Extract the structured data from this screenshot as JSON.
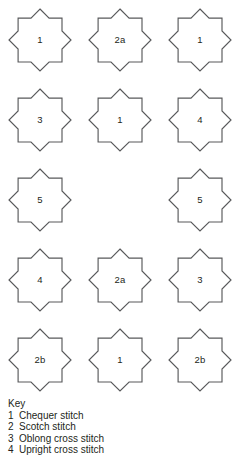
{
  "diagram": {
    "type": "stitch-placement-chart",
    "shape": "eight-pointed-star",
    "columns": 3,
    "rows": 5,
    "outline_color": "#58595b",
    "fill_color": "#ffffff",
    "text_color": "#231f20",
    "cells": [
      {
        "row": 1,
        "col": 1,
        "label": "1",
        "empty": false
      },
      {
        "row": 1,
        "col": 2,
        "label": "2a",
        "empty": false
      },
      {
        "row": 1,
        "col": 3,
        "label": "1",
        "empty": false
      },
      {
        "row": 2,
        "col": 1,
        "label": "3",
        "empty": false
      },
      {
        "row": 2,
        "col": 2,
        "label": "1",
        "empty": false
      },
      {
        "row": 2,
        "col": 3,
        "label": "4",
        "empty": false
      },
      {
        "row": 3,
        "col": 1,
        "label": "5",
        "empty": false
      },
      {
        "row": 3,
        "col": 2,
        "label": "",
        "empty": true
      },
      {
        "row": 3,
        "col": 3,
        "label": "5",
        "empty": false
      },
      {
        "row": 4,
        "col": 1,
        "label": "4",
        "empty": false
      },
      {
        "row": 4,
        "col": 2,
        "label": "2a",
        "empty": false
      },
      {
        "row": 4,
        "col": 3,
        "label": "3",
        "empty": false
      },
      {
        "row": 5,
        "col": 1,
        "label": "2b",
        "empty": false
      },
      {
        "row": 5,
        "col": 2,
        "label": "1",
        "empty": false
      },
      {
        "row": 5,
        "col": 3,
        "label": "2b",
        "empty": false
      }
    ]
  },
  "key": {
    "title": "Key",
    "entries": [
      {
        "number": "1",
        "text": "Chequer stitch"
      },
      {
        "number": "2",
        "text": "Scotch stitch"
      },
      {
        "number": "3",
        "text": "Oblong cross stitch"
      },
      {
        "number": "4",
        "text": "Upright cross stitch"
      }
    ]
  }
}
